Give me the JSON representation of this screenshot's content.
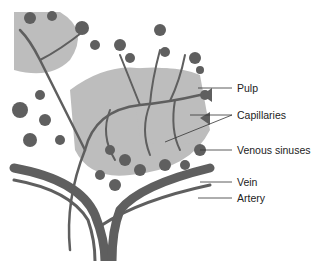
{
  "diagram": {
    "labels": [
      {
        "id": "pulp",
        "text": "Pulp"
      },
      {
        "id": "capillaries",
        "text": "Capillaries"
      },
      {
        "id": "venous_sinuses",
        "text": "Venous sinuses"
      },
      {
        "id": "vein",
        "text": "Vein"
      },
      {
        "id": "artery",
        "text": "Artery"
      }
    ],
    "colors": {
      "vessel": "#5f5f5f",
      "pulp": "#bdbdbd",
      "background": "#ffffff",
      "leader_line": "#333333",
      "text": "#222222"
    }
  }
}
